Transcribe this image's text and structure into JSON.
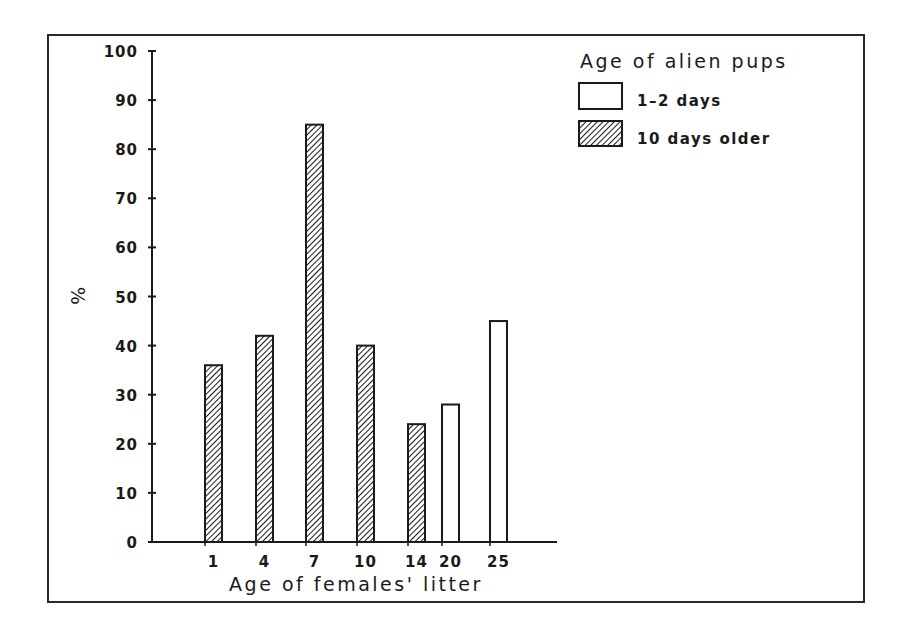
{
  "chart_data": {
    "type": "bar",
    "title": "",
    "xlabel": "Age of females' litter",
    "ylabel": "%",
    "ylim": [
      0,
      100
    ],
    "yticks": [
      0,
      10,
      20,
      30,
      40,
      50,
      60,
      70,
      80,
      90,
      100
    ],
    "grid": false,
    "legend_position": "top-right",
    "legend_title": "Age of alien pups",
    "categories": [
      "1",
      "4",
      "7",
      "10",
      "14",
      "20",
      "25"
    ],
    "series": [
      {
        "name": "1-2 days",
        "pattern": "open",
        "values": [
          null,
          null,
          null,
          null,
          null,
          28,
          45
        ]
      },
      {
        "name": "10 days older",
        "pattern": "hatched",
        "values": [
          36,
          42,
          85,
          40,
          24,
          null,
          null
        ]
      }
    ]
  },
  "legend": {
    "title": "Age of alien pups",
    "items": [
      {
        "label": "1–2 days",
        "pattern": "open"
      },
      {
        "label": "10 days older",
        "pattern": "hatched"
      }
    ]
  },
  "axes": {
    "y_label": "%",
    "x_label": "Age of females' litter"
  },
  "colors": {
    "ink": "#1a1a1a",
    "background": "#ffffff"
  }
}
